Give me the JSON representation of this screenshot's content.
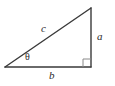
{
  "diagram": {
    "type": "right-triangle",
    "background_color": "#ffffff",
    "stroke_color": "#3a3a3a",
    "label_color": "#2b2b2b",
    "stroke_width": 1.4,
    "vertices": {
      "left": {
        "x": 5,
        "y": 67
      },
      "top_right": {
        "x": 91,
        "y": 8
      },
      "bottom_right": {
        "x": 91,
        "y": 67
      }
    },
    "right_angle_marker": {
      "present": true,
      "size": 8,
      "corner": "bottom-right"
    },
    "labels": {
      "hypotenuse": "c",
      "opposite": "a",
      "adjacent": "b",
      "angle": "θ"
    }
  }
}
